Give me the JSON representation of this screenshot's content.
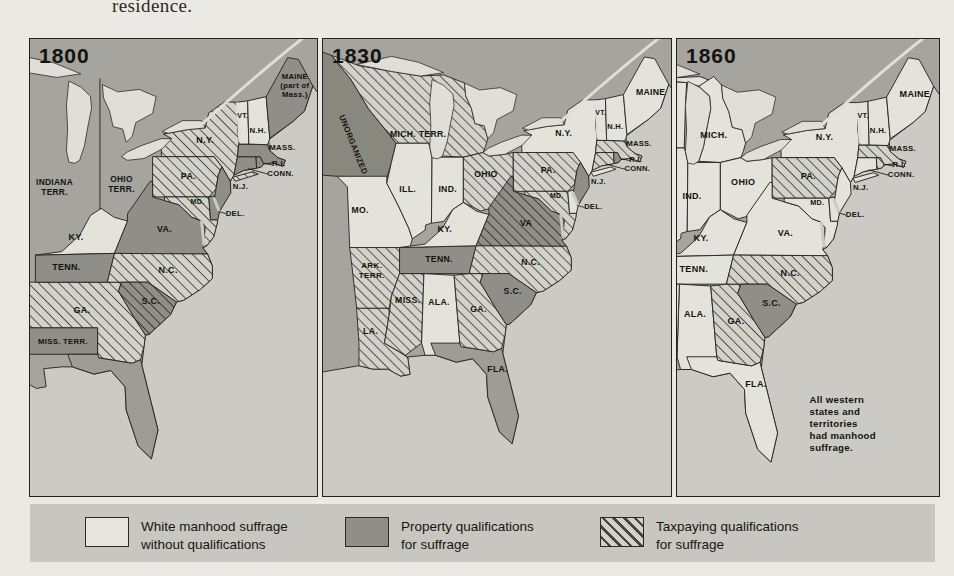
{
  "page": {
    "top_text": "residence."
  },
  "colors": {
    "white_manhood_suffrage": "#e3e2db",
    "property_qualification": "#8f8e88",
    "taxpaying_hatch_base": "#d2d1ca",
    "taxpaying_hatch_line": "#46453f",
    "territory": "#9d9c96",
    "background_land": "#a5a49e",
    "ocean": "#cbcac4"
  },
  "legend": {
    "items": [
      {
        "swatch": "plain",
        "label_line1": "White manhood suffrage",
        "label_line2": "without qualifications"
      },
      {
        "swatch": "dark",
        "label_line1": "Property qualifications",
        "label_line2": "for suffrage"
      },
      {
        "swatch": "hatch",
        "label_line1": "Taxpaying qualifications",
        "label_line2": "for suffrage"
      }
    ]
  },
  "panels": [
    {
      "year": "1800",
      "regions": {
        "GA1800": "tax",
        "MISSTERR": "dark",
        "FL": "terr",
        "NY": "tax",
        "PA": "tax",
        "VA": "dark",
        "MD": "tax",
        "DE": "dark",
        "NJ": "dark",
        "NC": "tax",
        "SC": "darktax",
        "KY": "light",
        "TN": "dark",
        "CT": "dark",
        "RI": "dark",
        "MA": "dark",
        "VT": "light",
        "NH": "light",
        "ME": "dark",
        "LI": "tax"
      },
      "labels": [
        {
          "lines": [
            "MAINE",
            "(part of",
            "Mass.)"
          ],
          "x": 548,
          "y": 66,
          "size": 13,
          "leading": 15
        },
        {
          "text": "VT.",
          "x": 461,
          "y": 131,
          "size": 12
        },
        {
          "text": "N.H.",
          "x": 486,
          "y": 156,
          "size": 13
        },
        {
          "text": "MASS.",
          "x": 527,
          "y": 185,
          "size": 13
        },
        {
          "text": "R.I.",
          "x": 521,
          "y": 212,
          "size": 13,
          "leader": [
            497,
            207,
            511,
            210
          ]
        },
        {
          "text": "CONN.",
          "x": 524,
          "y": 228,
          "size": 13,
          "leader": [
            470,
            216,
            503,
            225
          ]
        },
        {
          "text": "N.Y.",
          "x": 398,
          "y": 173
        },
        {
          "text": "PA.",
          "x": 370,
          "y": 233
        },
        {
          "text": "N.J.",
          "x": 457,
          "y": 250,
          "size": 13
        },
        {
          "text": "MD.",
          "x": 385,
          "y": 274,
          "size": 12
        },
        {
          "text": "DEL.",
          "x": 448,
          "y": 294,
          "size": 13,
          "leader": [
            420,
            287,
            433,
            291
          ]
        },
        {
          "text": "VA.",
          "x": 330,
          "y": 321
        },
        {
          "text": "KY.",
          "x": 182,
          "y": 334
        },
        {
          "text": "TENN.",
          "x": 166,
          "y": 385
        },
        {
          "text": "N.C.",
          "x": 336,
          "y": 390
        },
        {
          "text": "S.C.",
          "x": 307,
          "y": 442
        },
        {
          "text": "GA.",
          "x": 192,
          "y": 457
        },
        {
          "text": "MISS. TERR.",
          "x": 160,
          "y": 508,
          "size": 13
        },
        {
          "lines": [
            "INDIANA",
            "TERR."
          ],
          "x": 146,
          "y": 243,
          "size": 14,
          "leading": 16
        },
        {
          "lines": [
            "OHIO",
            "TERR."
          ],
          "x": 258,
          "y": 238,
          "size": 14,
          "leading": 16
        }
      ]
    },
    {
      "year": "1830",
      "regions": {
        "MICHTERR": "tax",
        "UNORG": "unorg",
        "MO": "light",
        "AR": "tax",
        "LA": "tax",
        "MS": "tax",
        "AL": "light",
        "FL": "terr",
        "GA": "tax",
        "TN": "dark",
        "KY": "light",
        "IL": "light",
        "IN": "light",
        "OH": "tax",
        "NY": "light",
        "PA": "tax",
        "VA": "darktax",
        "NC": "tax",
        "SC": "dark",
        "MD": "tax",
        "DE": "light",
        "NJ": "dark",
        "CT": "tax",
        "RI": "dark",
        "MA": "tax",
        "VT": "light",
        "NH": "light",
        "ME": "light",
        "LI": "light"
      },
      "labels": [
        {
          "text": "MAINE",
          "x": 547,
          "y": 96
        },
        {
          "text": "VT.",
          "x": 461,
          "y": 131,
          "size": 12
        },
        {
          "text": "N.H.",
          "x": 486,
          "y": 156,
          "size": 13
        },
        {
          "text": "MASS.",
          "x": 527,
          "y": 185,
          "size": 13
        },
        {
          "text": "R.I.",
          "x": 521,
          "y": 212,
          "size": 13,
          "leader": [
            497,
            207,
            511,
            210
          ]
        },
        {
          "text": "CONN.",
          "x": 524,
          "y": 228,
          "size": 13,
          "leader": [
            470,
            216,
            503,
            225
          ]
        },
        {
          "text": "N.Y.",
          "x": 397,
          "y": 167
        },
        {
          "text": "PA.",
          "x": 370,
          "y": 231
        },
        {
          "text": "N.J.",
          "x": 457,
          "y": 250,
          "size": 13
        },
        {
          "text": "MD.",
          "x": 385,
          "y": 274,
          "size": 12
        },
        {
          "text": "DEL.",
          "x": 448,
          "y": 294,
          "size": 13,
          "leader": [
            420,
            287,
            433,
            291
          ]
        },
        {
          "text": "VA",
          "x": 332,
          "y": 323
        },
        {
          "text": "KY.",
          "x": 192,
          "y": 334
        },
        {
          "text": "TENN.",
          "x": 182,
          "y": 385
        },
        {
          "text": "MO.",
          "x": 46,
          "y": 301
        },
        {
          "text": "ILL.",
          "x": 128,
          "y": 265
        },
        {
          "text": "IND.",
          "x": 197,
          "y": 265
        },
        {
          "text": "OHIO",
          "x": 263,
          "y": 238
        },
        {
          "text": "MICH. TERR.",
          "x": 146,
          "y": 170
        },
        {
          "text": "UNORGANIZED",
          "x": 30,
          "y": 184,
          "rot": 68,
          "size": 14
        },
        {
          "lines": [
            "ARK.",
            "TERR."
          ],
          "x": 66,
          "y": 396,
          "size": 14,
          "leading": 16
        },
        {
          "text": "MISS.",
          "x": 128,
          "y": 456
        },
        {
          "text": "ALA.",
          "x": 182,
          "y": 459
        },
        {
          "text": "LA.",
          "x": 64,
          "y": 509
        },
        {
          "text": "GA.",
          "x": 250,
          "y": 471
        },
        {
          "text": "S.C.",
          "x": 309,
          "y": 441
        },
        {
          "text": "N.C.",
          "x": 340,
          "y": 391
        },
        {
          "text": "FLA.",
          "x": 283,
          "y": 575
        }
      ]
    },
    {
      "year": "1860",
      "regions": {
        "WI": "light",
        "UP": "light",
        "MI": "light",
        "IL": "light",
        "IN": "light",
        "OH": "light",
        "MO": "light",
        "KY": "light",
        "TN": "light",
        "AL": "light",
        "MS": "light",
        "FL": "light",
        "GA": "tax",
        "NY": "light",
        "PA": "tax",
        "VA": "light",
        "NC": "tax",
        "SC": "dark",
        "MD": "light",
        "DE": "light",
        "NJ": "light",
        "CT": "light",
        "RI": "tax",
        "MA": "tax",
        "VT": "light",
        "NH": "light",
        "ME": "light",
        "LI": "light"
      },
      "labels": [
        {
          "text": "MAINE",
          "x": 547,
          "y": 96
        },
        {
          "text": "VT.",
          "x": 461,
          "y": 131,
          "size": 12
        },
        {
          "text": "N.H.",
          "x": 486,
          "y": 156,
          "size": 13
        },
        {
          "text": "MASS.",
          "x": 527,
          "y": 185,
          "size": 13
        },
        {
          "text": "R.I.",
          "x": 521,
          "y": 212,
          "size": 13,
          "leader": [
            497,
            207,
            511,
            210
          ]
        },
        {
          "text": "CONN.",
          "x": 524,
          "y": 228,
          "size": 13,
          "leader": [
            470,
            216,
            503,
            225
          ]
        },
        {
          "text": "N.Y.",
          "x": 397,
          "y": 167
        },
        {
          "text": "PA.",
          "x": 370,
          "y": 231
        },
        {
          "text": "N.J.",
          "x": 457,
          "y": 250,
          "size": 13
        },
        {
          "text": "MD.",
          "x": 385,
          "y": 274,
          "size": 12
        },
        {
          "text": "DEL.",
          "x": 448,
          "y": 294,
          "size": 13,
          "leader": [
            420,
            287,
            433,
            291
          ]
        },
        {
          "text": "VA.",
          "x": 332,
          "y": 326
        },
        {
          "text": "KY.",
          "x": 192,
          "y": 334
        },
        {
          "text": "TENN.",
          "x": 180,
          "y": 385
        },
        {
          "text": "N.C.",
          "x": 340,
          "y": 391
        },
        {
          "text": "S.C.",
          "x": 309,
          "y": 441
        },
        {
          "text": "GA.",
          "x": 250,
          "y": 471
        },
        {
          "text": "ALA.",
          "x": 182,
          "y": 459
        },
        {
          "text": "FLA.",
          "x": 283,
          "y": 575
        },
        {
          "text": "MICH.",
          "x": 213,
          "y": 163
        },
        {
          "text": "OHIO",
          "x": 262,
          "y": 241
        },
        {
          "text": "IND.",
          "x": 177,
          "y": 265
        },
        {
          "lines": [
            "All western",
            "states and",
            "territories",
            "had manhood",
            "suffrage."
          ],
          "x": 372,
          "y": 601,
          "size": 16,
          "leading": 20,
          "anchor": "start"
        }
      ]
    }
  ]
}
